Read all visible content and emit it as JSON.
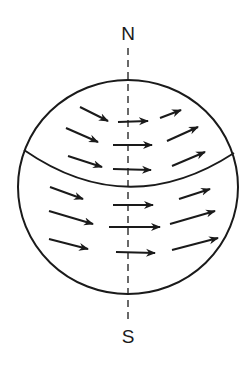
{
  "diagram": {
    "title": "",
    "labels": {
      "north": "N",
      "south": "S"
    },
    "colors": {
      "stroke": "#1a1a1a",
      "background": "#ffffff"
    },
    "globe": {
      "cx": 128,
      "cy": 187,
      "rx": 110,
      "ry": 107
    },
    "axis": {
      "x": 128,
      "y1": 48,
      "y2": 320,
      "style": "dashed"
    },
    "boundary_curve": {
      "from": [
        24,
        150
      ],
      "control": [
        128,
        222
      ],
      "to": [
        234,
        153
      ]
    },
    "arrows": [
      {
        "x1": 80,
        "y1": 107,
        "x2": 108,
        "y2": 121
      },
      {
        "x1": 118,
        "y1": 122,
        "x2": 148,
        "y2": 121
      },
      {
        "x1": 160,
        "y1": 118,
        "x2": 181,
        "y2": 110
      },
      {
        "x1": 66,
        "y1": 128,
        "x2": 98,
        "y2": 142
      },
      {
        "x1": 113,
        "y1": 145,
        "x2": 152,
        "y2": 145
      },
      {
        "x1": 167,
        "y1": 141,
        "x2": 198,
        "y2": 127
      },
      {
        "x1": 68,
        "y1": 156,
        "x2": 102,
        "y2": 167
      },
      {
        "x1": 113,
        "y1": 169,
        "x2": 151,
        "y2": 170
      },
      {
        "x1": 172,
        "y1": 166,
        "x2": 205,
        "y2": 152
      },
      {
        "x1": 50,
        "y1": 187,
        "x2": 83,
        "y2": 199
      },
      {
        "x1": 113,
        "y1": 205,
        "x2": 153,
        "y2": 205
      },
      {
        "x1": 179,
        "y1": 199,
        "x2": 210,
        "y2": 189
      },
      {
        "x1": 49,
        "y1": 211,
        "x2": 93,
        "y2": 224
      },
      {
        "x1": 109,
        "y1": 227,
        "x2": 160,
        "y2": 227
      },
      {
        "x1": 170,
        "y1": 224,
        "x2": 215,
        "y2": 211
      },
      {
        "x1": 49,
        "y1": 239,
        "x2": 88,
        "y2": 249
      },
      {
        "x1": 116,
        "y1": 252,
        "x2": 155,
        "y2": 253
      },
      {
        "x1": 172,
        "y1": 250,
        "x2": 218,
        "y2": 238
      }
    ]
  }
}
